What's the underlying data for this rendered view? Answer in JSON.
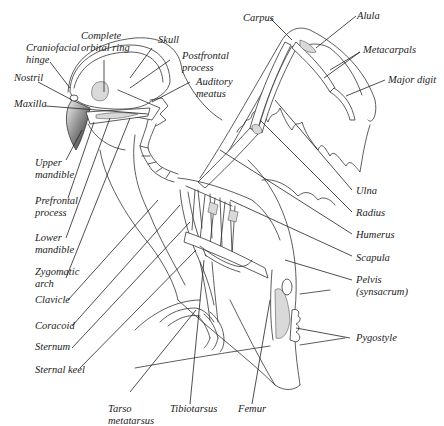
{
  "figure": {
    "labels": {
      "complete_orbital_ring": [
        "Complete",
        "orbital ring"
      ],
      "craniofacial_hinge": [
        "Craniofacial",
        "hinge"
      ],
      "skull": [
        "Skull"
      ],
      "postfrontal_process": [
        "Postfrontal",
        "process"
      ],
      "auditory_meatus": [
        "Auditory",
        "meatus"
      ],
      "nostril": [
        "Nostril"
      ],
      "maxilla": [
        "Maxilla"
      ],
      "upper_mandible": [
        "Upper",
        "mandible"
      ],
      "prefrontal_process": [
        "Prefrontal",
        "process"
      ],
      "lower_mandible": [
        "Lower",
        "mandible"
      ],
      "zygomatic_arch": [
        "Zygomatic",
        "arch"
      ],
      "clavicle": [
        "Clavicle"
      ],
      "coracoid": [
        "Coracoid"
      ],
      "sternum": [
        "Sternum"
      ],
      "sternal_keel": [
        "Sternal keel"
      ],
      "tarso_metatarsus": [
        "Tarso",
        "metatarsus"
      ],
      "tibiotarsus": [
        "Tibiotarsus"
      ],
      "femur": [
        "Femur"
      ],
      "carpus": [
        "Carpus"
      ],
      "alula": [
        "Alula"
      ],
      "metacarpals": [
        "Metacarpals"
      ],
      "major_digit": [
        "Major digit"
      ],
      "ulna": [
        "Ulna"
      ],
      "radius": [
        "Radius"
      ],
      "humerus": [
        "Humerus"
      ],
      "scapula": [
        "Scapula"
      ],
      "pelvis": [
        "Pelvis",
        "(synsacrum)"
      ],
      "pygostyle": [
        "Pygostyle"
      ]
    }
  }
}
